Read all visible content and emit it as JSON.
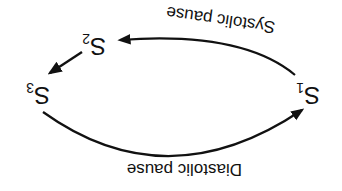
{
  "diagram": {
    "orientation": "rotated 180 degrees (upside-down)",
    "nodes": [
      {
        "id": "S1",
        "base": "S",
        "sub": "1"
      },
      {
        "id": "S2",
        "base": "S",
        "sub": "2"
      },
      {
        "id": "S3",
        "base": "S",
        "sub": "3"
      }
    ],
    "edges": [
      {
        "from": "S1",
        "to": "S2",
        "label": "Systolic pause"
      },
      {
        "from": "S2",
        "to": "S3",
        "label": ""
      },
      {
        "from": "S3",
        "to": "S1",
        "label": "Diastolic pause"
      }
    ],
    "colors": {
      "stroke": "#111111",
      "background": "#ffffff"
    }
  }
}
